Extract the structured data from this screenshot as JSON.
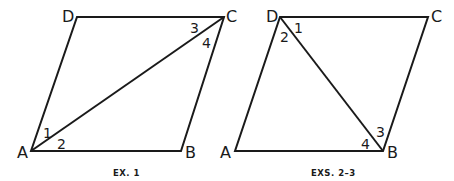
{
  "figures": [
    {
      "caption": "EX. 1",
      "vertices": {
        "A": "A",
        "B": "B",
        "C": "C",
        "D": "D"
      },
      "diagonal": "AC",
      "angles": [
        "1",
        "2",
        "3",
        "4"
      ]
    },
    {
      "caption": "EXS. 2–3",
      "vertices": {
        "A": "A",
        "B": "B",
        "C": "C",
        "D": "D"
      },
      "diagonal": "DB",
      "angles": [
        "1",
        "2",
        "3",
        "4"
      ]
    }
  ]
}
